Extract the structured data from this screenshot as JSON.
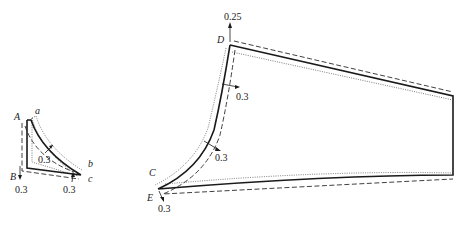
{
  "diagram": {
    "type": "pattern-pieces-with-seam-allowance",
    "small_piece": {
      "points": {
        "A": "A",
        "B": "B",
        "a": "a",
        "b": "b",
        "c": "c"
      },
      "allowances": {
        "inner": "0.3",
        "bottom_left": "0.3",
        "bottom_right": "0.3"
      }
    },
    "large_piece": {
      "points": {
        "C": "C",
        "D": "D",
        "E": "E"
      },
      "allowances": {
        "top": "0.25",
        "upper_curve": "0.3",
        "lower_curve": "0.3",
        "bottom": "0.3"
      }
    },
    "line_styles": {
      "solid": "net pattern line",
      "dashed": "seam allowance line",
      "dotted": "reference line"
    }
  }
}
